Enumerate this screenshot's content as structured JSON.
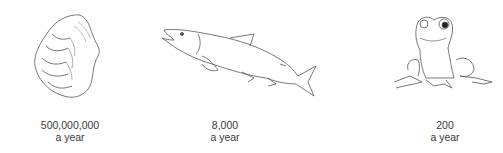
{
  "figure": {
    "items": [
      {
        "animal": "oyster",
        "icon": "oyster-icon",
        "count": "500,000,000",
        "unit": "a year"
      },
      {
        "animal": "salmon",
        "icon": "salmon-icon",
        "count": "8,000",
        "unit": "a year"
      },
      {
        "animal": "frog",
        "icon": "frog-icon",
        "count": "200",
        "unit": "a year"
      }
    ]
  }
}
